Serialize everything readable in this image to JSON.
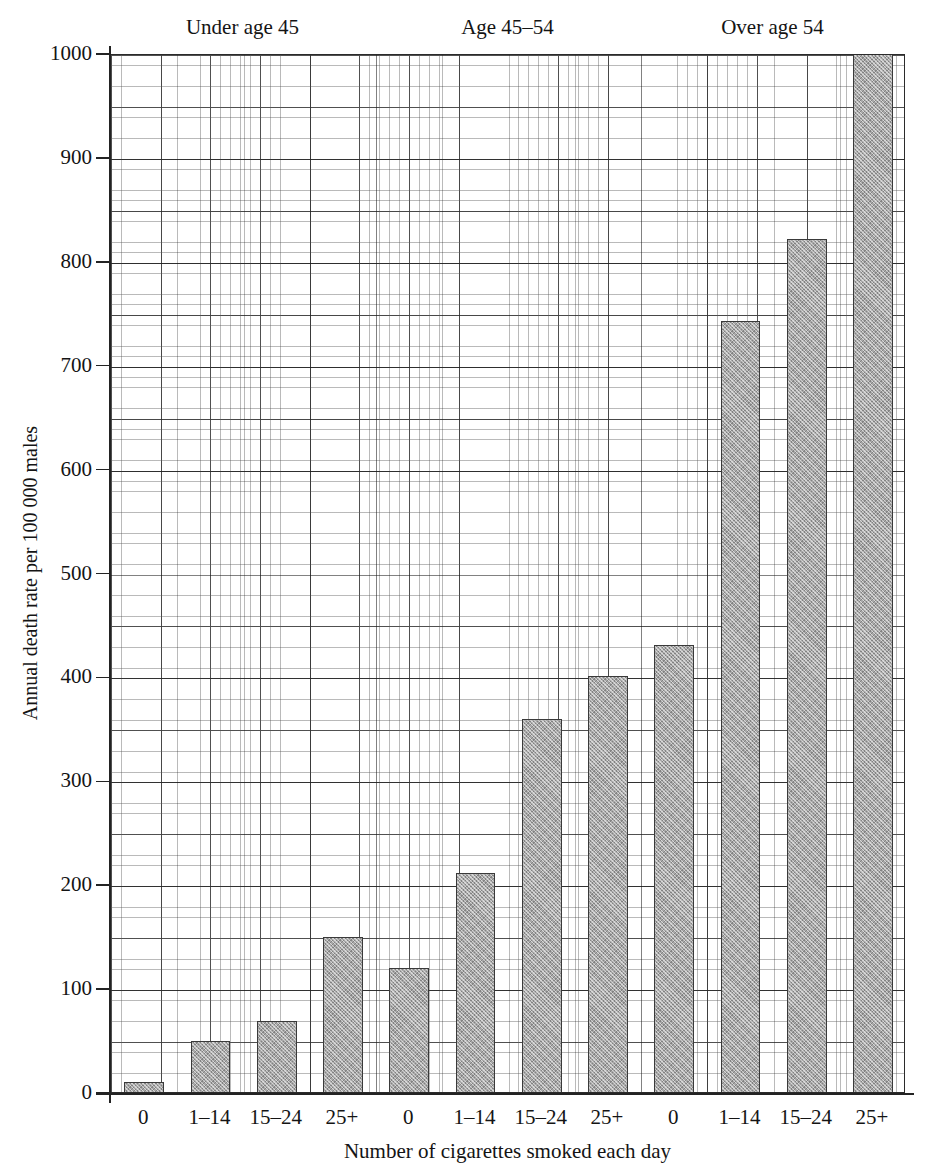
{
  "chart_data": {
    "type": "bar",
    "title": "",
    "xlabel": "Number of cigarettes smoked each day",
    "ylabel": "Annual death rate per 100 000 males",
    "ylim": [
      0,
      1000
    ],
    "yticks": [
      0,
      100,
      200,
      300,
      400,
      500,
      600,
      700,
      800,
      900,
      1000
    ],
    "grid": true,
    "legend_position": "none",
    "group_labels": [
      "Under age 45",
      "Age 45–54",
      "Over age 54"
    ],
    "categories": [
      "0",
      "1–14",
      "15–24",
      "25+",
      "0",
      "1–14",
      "15–24",
      "25+",
      "0",
      "1–14",
      "15–24",
      "25+"
    ],
    "values": [
      10,
      49,
      68,
      149,
      119,
      211,
      359,
      400,
      430,
      742,
      821,
      1000
    ],
    "bar_clipped_at_top": [
      false,
      false,
      false,
      false,
      false,
      false,
      false,
      false,
      false,
      false,
      false,
      true
    ],
    "groups": [
      {
        "label": "Under age 45",
        "categories": [
          "0",
          "1–14",
          "15–24",
          "25+"
        ],
        "values": [
          10,
          49,
          68,
          149
        ]
      },
      {
        "label": "Age 45–54",
        "categories": [
          "0",
          "1–14",
          "15–24",
          "25+"
        ],
        "values": [
          119,
          211,
          359,
          400
        ]
      },
      {
        "label": "Over age 54",
        "categories": [
          "0",
          "1–14",
          "15–24",
          "25+"
        ],
        "values": [
          430,
          742,
          821,
          1000
        ]
      }
    ],
    "colors": {
      "bar_fill": "#a8a8a8",
      "bar_edge": "#3a3a3a",
      "axis": "#232323",
      "grid_minor": "#5a5a5a",
      "grid_major": "#282828",
      "text": "#141414",
      "background": "#ffffff"
    }
  }
}
